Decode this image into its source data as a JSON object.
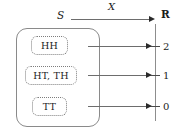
{
  "diagram": {
    "sample_space_label": "S",
    "mapping_label": "X",
    "codomain_label": "R",
    "events": [
      {
        "id": "hh",
        "label": "HH",
        "value": "2"
      },
      {
        "id": "ht_th",
        "label": "HT, TH",
        "value": "1"
      },
      {
        "id": "tt",
        "label": "TT",
        "value": "0"
      }
    ],
    "axis": {
      "orientation": "vertical",
      "ticks": [
        "2",
        "1",
        "0"
      ]
    },
    "colors": {
      "text": "#1b1b1b",
      "outline": "#8a8a8a",
      "dotted_outline": "#7d7d7d",
      "arrow": "#6d6d6d",
      "arrowhead": "#2a2a2a",
      "background": "#ffffff"
    }
  },
  "chart_data": {
    "type": "diagram",
    "categories": [
      "HH",
      "HT, TH",
      "TT"
    ],
    "values": [
      2,
      1,
      0
    ],
    "xlabel": "S",
    "ylabel": "R",
    "series": [
      {
        "name": "X",
        "values": [
          2,
          1,
          0
        ]
      }
    ],
    "annotations": [
      "S",
      "X",
      "R"
    ]
  }
}
